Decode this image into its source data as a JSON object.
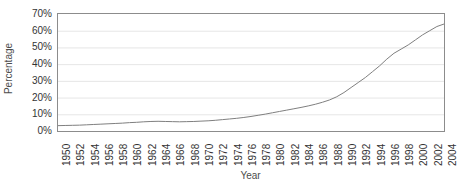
{
  "chart_data": {
    "type": "line",
    "title": "",
    "xlabel": "Year",
    "ylabel": "Percentage",
    "xlim": [
      1950,
      2004
    ],
    "ylim": [
      0,
      70
    ],
    "ytick_labels": [
      "0%",
      "10%",
      "20%",
      "30%",
      "40%",
      "50%",
      "60%",
      "70%"
    ],
    "ytick_values": [
      0,
      10,
      20,
      30,
      40,
      50,
      60,
      70
    ],
    "xtick_labels": [
      "1950",
      "1952",
      "1954",
      "1956",
      "1958",
      "1960",
      "1962",
      "1964",
      "1966",
      "1968",
      "1970",
      "1972",
      "1974",
      "1976",
      "1978",
      "1980",
      "1982",
      "1984",
      "1986",
      "1988",
      "1990",
      "1992",
      "1994",
      "1996",
      "1998",
      "2000",
      "2002",
      "2004"
    ],
    "xtick_values": [
      1950,
      1952,
      1954,
      1956,
      1958,
      1960,
      1962,
      1964,
      1966,
      1968,
      1970,
      1972,
      1974,
      1976,
      1978,
      1980,
      1982,
      1984,
      1986,
      1988,
      1990,
      1992,
      1994,
      1996,
      1998,
      2000,
      2002,
      2004
    ],
    "minor_tick_step": 1,
    "grid": "horizontal",
    "grid_color": "#e6e6e6",
    "axis_color": "#8c8c8c",
    "line_color": "#7f7f7f",
    "line_width": 1,
    "legend": "none",
    "x": [
      1950,
      1951,
      1952,
      1953,
      1954,
      1955,
      1956,
      1957,
      1958,
      1959,
      1960,
      1961,
      1962,
      1963,
      1964,
      1965,
      1966,
      1967,
      1968,
      1969,
      1970,
      1971,
      1972,
      1973,
      1974,
      1975,
      1976,
      1977,
      1978,
      1979,
      1980,
      1981,
      1982,
      1983,
      1984,
      1985,
      1986,
      1987,
      1988,
      1989,
      1990,
      1991,
      1992,
      1993,
      1994,
      1995,
      1996,
      1997,
      1998,
      1999,
      2000,
      2001,
      2002,
      2003,
      2004
    ],
    "y": [
      3.2,
      3.3,
      3.4,
      3.5,
      3.7,
      3.9,
      4.1,
      4.3,
      4.5,
      4.7,
      5.0,
      5.2,
      5.5,
      5.7,
      5.8,
      5.7,
      5.6,
      5.5,
      5.6,
      5.7,
      5.9,
      6.1,
      6.4,
      6.8,
      7.2,
      7.6,
      8.1,
      8.7,
      9.4,
      10.1,
      10.9,
      11.7,
      12.5,
      13.3,
      14.1,
      15.0,
      16.0,
      17.2,
      18.6,
      20.5,
      23.0,
      26.0,
      29.0,
      32.0,
      35.5,
      39.0,
      43.0,
      46.5,
      49.0,
      51.5,
      54.5,
      57.5,
      60.0,
      62.5,
      64.0
    ],
    "series_name": "Percentage"
  }
}
